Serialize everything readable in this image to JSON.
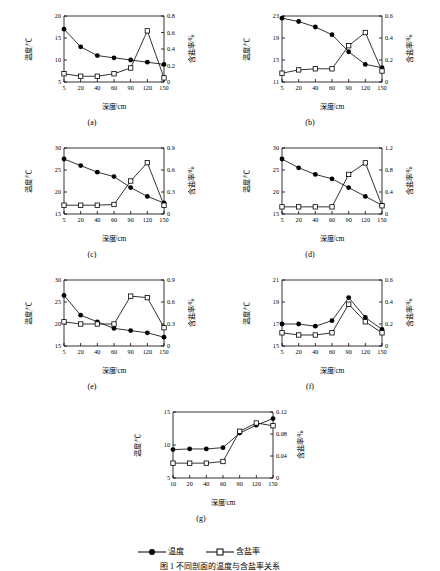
{
  "figure": {
    "title": "图 1  不同剖面的温度与含盐率关系",
    "legend": [
      {
        "label": "温度",
        "marker": "filled-circle"
      },
      {
        "label": "含盐率",
        "marker": "open-square"
      }
    ]
  },
  "panels": [
    {
      "caption": "(a)",
      "chart_data": {
        "type": "line",
        "title": "",
        "xlabel": "深度/cm",
        "ylabel_left": "温度/℃",
        "ylabel_right": "含盐率/%",
        "x": [
          5,
          20,
          40,
          60,
          90,
          120,
          150
        ],
        "xticks": [
          5,
          20,
          40,
          60,
          90,
          120,
          150
        ],
        "yticks_left": [
          5,
          10,
          15,
          20
        ],
        "yticks_right": [
          0,
          0.2,
          0.4,
          0.6,
          0.8
        ],
        "ylim_left": [
          5,
          20
        ],
        "ylim_right": [
          0,
          0.8
        ],
        "grid": false,
        "series": [
          {
            "name": "温度",
            "axis": "left",
            "values": [
              17.0,
              13.0,
              11.0,
              10.5,
              10.0,
              9.5,
              9.0
            ]
          },
          {
            "name": "含盐率",
            "axis": "right",
            "values": [
              0.1,
              0.07,
              0.07,
              0.1,
              0.17,
              0.62,
              0.05
            ]
          }
        ]
      }
    },
    {
      "caption": "(b)",
      "chart_data": {
        "type": "line",
        "title": "",
        "xlabel": "深度/cm",
        "ylabel_left": "温度/℃",
        "ylabel_right": "含盐率/%",
        "x": [
          5,
          20,
          40,
          60,
          90,
          120,
          150
        ],
        "xticks": [
          5,
          20,
          40,
          60,
          90,
          120,
          150
        ],
        "yticks_left": [
          11,
          15,
          19,
          23
        ],
        "yticks_right": [
          0,
          0.2,
          0.4,
          0.6
        ],
        "ylim_left": [
          11,
          23
        ],
        "ylim_right": [
          0,
          0.6
        ],
        "grid": false,
        "series": [
          {
            "name": "温度",
            "axis": "left",
            "values": [
              22.6,
              22.0,
              21.0,
              19.6,
              16.5,
              14.2,
              13.6
            ]
          },
          {
            "name": "含盐率",
            "axis": "right",
            "values": [
              0.08,
              0.11,
              0.12,
              0.12,
              0.33,
              0.45,
              0.1
            ]
          }
        ]
      }
    },
    {
      "caption": "(c)",
      "chart_data": {
        "type": "line",
        "title": "",
        "xlabel": "深度/cm",
        "ylabel_left": "温度/℃",
        "ylabel_right": "含盐率/%",
        "x": [
          5,
          20,
          40,
          60,
          90,
          120,
          150
        ],
        "xticks": [
          5,
          20,
          40,
          60,
          90,
          120,
          150
        ],
        "yticks_left": [
          15,
          20,
          25,
          30
        ],
        "yticks_right": [
          0,
          0.3,
          0.6,
          0.9
        ],
        "ylim_left": [
          15,
          30
        ],
        "ylim_right": [
          0,
          0.9
        ],
        "grid": false,
        "series": [
          {
            "name": "温度",
            "axis": "left",
            "values": [
              27.5,
              26.0,
              24.5,
              23.5,
              21.0,
              19.0,
              17.5
            ]
          },
          {
            "name": "含盐率",
            "axis": "right",
            "values": [
              0.12,
              0.12,
              0.12,
              0.13,
              0.45,
              0.7,
              0.12
            ]
          }
        ]
      }
    },
    {
      "caption": "(d)",
      "chart_data": {
        "type": "line",
        "title": "",
        "xlabel": "深度/cm",
        "ylabel_left": "温度/℃",
        "ylabel_right": "含盐率/%",
        "x": [
          5,
          20,
          40,
          60,
          90,
          120,
          150
        ],
        "xticks": [
          5,
          20,
          40,
          60,
          90,
          120,
          150
        ],
        "yticks_left": [
          15,
          20,
          25,
          30
        ],
        "yticks_right": [
          0,
          0.4,
          0.8,
          1.2
        ],
        "ylim_left": [
          15,
          30
        ],
        "ylim_right": [
          0,
          1.2
        ],
        "grid": false,
        "series": [
          {
            "name": "温度",
            "axis": "left",
            "values": [
              27.5,
              25.5,
              24.0,
              23.0,
              21.0,
              19.0,
              17.0
            ]
          },
          {
            "name": "含盐率",
            "axis": "right",
            "values": [
              0.13,
              0.13,
              0.13,
              0.13,
              0.72,
              0.93,
              0.15
            ]
          }
        ]
      }
    },
    {
      "caption": "(e)",
      "chart_data": {
        "type": "line",
        "title": "",
        "xlabel": "深度/cm",
        "ylabel_left": "温度/℃",
        "ylabel_right": "含盐率/%",
        "x": [
          5,
          20,
          40,
          60,
          90,
          120,
          150
        ],
        "xticks": [
          5,
          20,
          40,
          60,
          90,
          120,
          150
        ],
        "yticks_left": [
          15,
          20,
          25,
          30
        ],
        "yticks_right": [
          0,
          0.3,
          0.6,
          0.9
        ],
        "ylim_left": [
          15,
          30
        ],
        "ylim_right": [
          0,
          0.9
        ],
        "grid": false,
        "series": [
          {
            "name": "温度",
            "axis": "left",
            "values": [
              26.5,
              22.0,
              20.5,
              19.0,
              18.5,
              18.0,
              17.0
            ]
          },
          {
            "name": "含盐率",
            "axis": "right",
            "values": [
              0.33,
              0.3,
              0.3,
              0.3,
              0.68,
              0.66,
              0.25
            ]
          }
        ]
      }
    },
    {
      "caption": "(f)",
      "chart_data": {
        "type": "line",
        "title": "",
        "xlabel": "深度/cm",
        "ylabel_left": "温度/℃",
        "ylabel_right": "含盐率/%",
        "x": [
          5,
          20,
          40,
          60,
          90,
          120,
          150
        ],
        "xticks": [
          5,
          20,
          40,
          60,
          90,
          120,
          150
        ],
        "yticks_left": [
          15,
          17,
          19,
          21
        ],
        "yticks_right": [
          0,
          0.2,
          0.4,
          0.6
        ],
        "ylim_left": [
          15,
          21
        ],
        "ylim_right": [
          0,
          0.6
        ],
        "grid": false,
        "series": [
          {
            "name": "温度",
            "axis": "left",
            "values": [
              17.0,
              17.0,
              16.8,
              17.3,
              19.4,
              17.6,
              16.5
            ]
          },
          {
            "name": "含盐率",
            "axis": "right",
            "values": [
              0.12,
              0.1,
              0.1,
              0.12,
              0.38,
              0.22,
              0.12
            ]
          }
        ]
      }
    },
    {
      "caption": "(g)",
      "chart_data": {
        "type": "line",
        "title": "",
        "xlabel": "深度/cm",
        "ylabel_left": "温度/℃",
        "ylabel_right": "含盐率/%",
        "x": [
          10,
          20,
          40,
          60,
          90,
          120,
          150
        ],
        "xticks": [
          10,
          20,
          40,
          60,
          90,
          120,
          150
        ],
        "yticks_left": [
          5,
          10,
          15
        ],
        "yticks_right": [
          0,
          0.04,
          0.08,
          0.12
        ],
        "ylim_left": [
          5,
          15
        ],
        "ylim_right": [
          0,
          0.12
        ],
        "grid": false,
        "series": [
          {
            "name": "温度",
            "axis": "left",
            "values": [
              9.3,
              9.4,
              9.4,
              9.6,
              11.8,
              13.0,
              14.0
            ]
          },
          {
            "name": "含盐率",
            "axis": "right",
            "values": [
              0.027,
              0.027,
              0.027,
              0.03,
              0.085,
              0.1,
              0.095
            ]
          }
        ]
      }
    }
  ]
}
